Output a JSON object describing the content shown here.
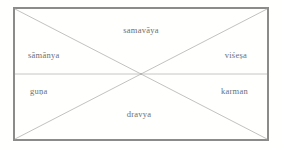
{
  "diagram": {
    "type": "rectangle-with-diagonals",
    "geometry": {
      "left": 14,
      "top": 8,
      "right": 268,
      "bottom": 140,
      "center_x": 141,
      "center_y": 74
    },
    "colors": {
      "border": "#7e7e7e",
      "inner_line": "#b9b9b9",
      "text": "#5d5d5d",
      "background": "#ffffff"
    },
    "labels": [
      {
        "id": "top",
        "text": "samavāya",
        "x": 141,
        "y": 30,
        "align": "center"
      },
      {
        "id": "left",
        "text": "sāmānya",
        "x": 28,
        "y": 55,
        "align": "left"
      },
      {
        "id": "right",
        "text": "viśeṣa",
        "x": 247,
        "y": 55,
        "align": "right"
      },
      {
        "id": "bottom-left",
        "text": "guṇa",
        "x": 30,
        "y": 91,
        "align": "left"
      },
      {
        "id": "bottom-right",
        "text": "karman",
        "x": 248,
        "y": 91,
        "align": "right"
      },
      {
        "id": "bottom",
        "text": "dravya",
        "x": 139,
        "y": 114,
        "align": "center"
      }
    ]
  }
}
